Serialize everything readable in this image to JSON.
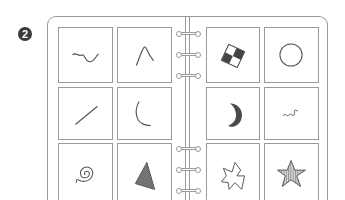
{
  "badge": {
    "label": "2"
  },
  "binder": {
    "left_page": {
      "cards": [
        {
          "shape": "squiggle-wave-icon"
        },
        {
          "shape": "peak-curve-icon"
        },
        {
          "shape": "diagonal-line-icon"
        },
        {
          "shape": "hook-curve-icon"
        },
        {
          "shape": "spiral-icon"
        },
        {
          "shape": "hatched-triangle-icon"
        }
      ]
    },
    "right_page": {
      "cards": [
        {
          "shape": "checkered-diamond-icon"
        },
        {
          "shape": "circle-outline-icon"
        },
        {
          "shape": "crescent-moon-icon"
        },
        {
          "shape": "small-squiggle-icon"
        },
        {
          "shape": "irregular-polygon-icon"
        },
        {
          "shape": "striped-star-icon"
        }
      ]
    },
    "rings": 6
  },
  "colors": {
    "stroke": "#9a9a9a",
    "ink": "#555555",
    "fill_dark": "#4a4a4a"
  }
}
